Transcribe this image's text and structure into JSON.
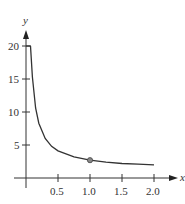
{
  "chart_data": {
    "type": "line",
    "title": "",
    "xlabel": "x",
    "ylabel": "y",
    "xlim": [
      0,
      2.2
    ],
    "ylim": [
      0,
      22
    ],
    "x_ticks": [
      "0.5",
      "1.0",
      "1.5",
      "2.0"
    ],
    "y_ticks": [
      "5",
      "10",
      "15",
      "20"
    ],
    "grid": false,
    "series": [
      {
        "name": "curve",
        "x": [
          0.07,
          0.1,
          0.15,
          0.2,
          0.3,
          0.4,
          0.5,
          0.75,
          1.0,
          1.25,
          1.5,
          1.75,
          2.0
        ],
        "y": [
          20,
          15.3,
          10.6,
          8.3,
          6.0,
          4.8,
          4.1,
          3.2,
          2.7,
          2.4,
          2.2,
          2.1,
          2.0
        ]
      }
    ],
    "highlight_point": {
      "x": 1.0,
      "y": 2.7
    },
    "line_color": "#333333",
    "point_color": "#777777"
  }
}
